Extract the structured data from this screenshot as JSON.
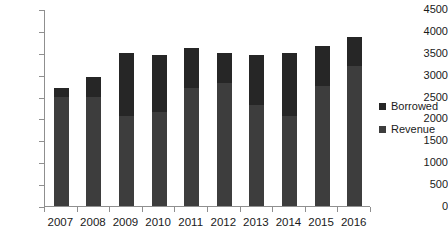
{
  "chart_data": {
    "type": "bar",
    "subtype": "stacked-column",
    "title": "",
    "xlabel": "",
    "ylabel": "",
    "categories": [
      "2007",
      "2008",
      "2009",
      "2010",
      "2011",
      "2012",
      "2013",
      "2014",
      "2015",
      "2016"
    ],
    "series": [
      {
        "name": "Revenue",
        "color": "#3d3d3d",
        "values": [
          2500,
          2500,
          2050,
          2150,
          2700,
          2800,
          2300,
          2050,
          2750,
          3200
        ]
      },
      {
        "name": "Borrowed",
        "color": "#262626",
        "values": [
          200,
          450,
          1450,
          1300,
          900,
          700,
          1150,
          1450,
          900,
          650
        ]
      }
    ],
    "totals": [
      2700,
      2950,
      3500,
      3450,
      3600,
      3500,
      3450,
      3500,
      3650,
      3850
    ],
    "ylim": [
      0,
      4500
    ],
    "yticks": [
      0,
      500,
      1000,
      1500,
      2000,
      2500,
      3000,
      3500,
      4000,
      4500
    ],
    "ytick_labels": [
      "0",
      "500",
      "1000",
      "1500",
      "2000",
      "2500",
      "3000",
      "3500",
      "4000",
      "4500"
    ],
    "grid": false,
    "legend_position": "right"
  },
  "legend": {
    "items": [
      {
        "label": "Borrowed",
        "color": "#262626"
      },
      {
        "label": "Revenue",
        "color": "#3d3d3d"
      }
    ]
  }
}
